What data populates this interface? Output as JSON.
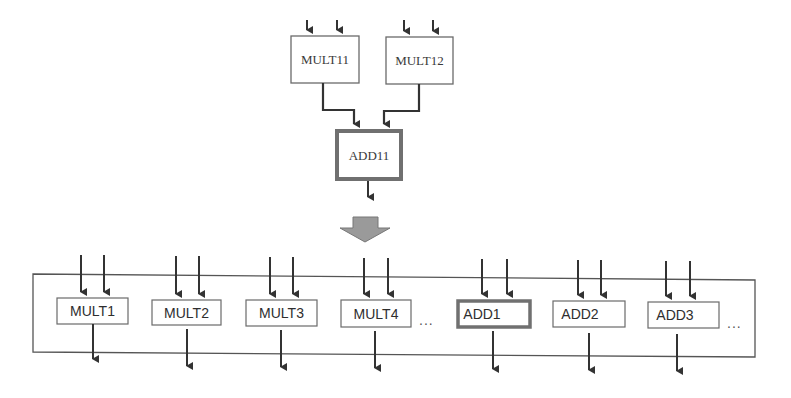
{
  "colors": {
    "line": "#3a3a3a",
    "box_border": "#6a6a6a",
    "highlight_border": "#707070",
    "big_arrow_fill": "#9a9a9a",
    "big_arrow_stroke": "#777777"
  },
  "top_section": {
    "mult_units": [
      {
        "label": "MULT11"
      },
      {
        "label": "MULT12"
      }
    ],
    "adder": {
      "label": "ADD11",
      "highlighted": true
    }
  },
  "transform_arrow": {
    "icon": "down-arrow-icon"
  },
  "bottom_section": {
    "units": [
      {
        "label": "MULT1",
        "highlighted": false
      },
      {
        "label": "MULT2",
        "highlighted": false
      },
      {
        "label": "MULT3",
        "highlighted": false
      },
      {
        "label": "MULT4",
        "highlighted": false
      },
      {
        "label": "ADD1",
        "highlighted": true
      },
      {
        "label": "ADD2",
        "highlighted": false
      },
      {
        "label": "ADD3",
        "highlighted": false
      }
    ],
    "ellipsis_after_mult": "...",
    "ellipsis_after_add": "..."
  }
}
